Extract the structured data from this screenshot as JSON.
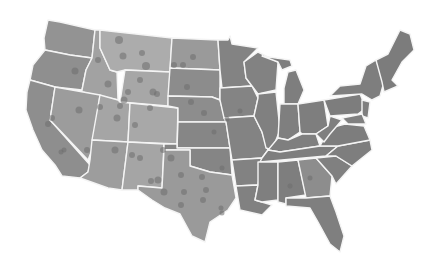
{
  "map": {
    "type": "choropleth-with-points",
    "region": "Contiguous United States",
    "colors": {
      "background": "#ffffff",
      "border": "#f4f4f4",
      "west_light": "#a9a9a9",
      "west_mid": "#9a9a9a",
      "central": "#858585",
      "east": "#7d7d7d",
      "dot": "#6e6e6e"
    }
  }
}
